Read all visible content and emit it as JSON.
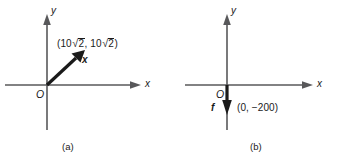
{
  "figure": {
    "background_color": "#ffffff",
    "axis_color": "#58585a",
    "vector_color": "#1a1a1a",
    "text_color": "#1a1a1a"
  },
  "panel_a": {
    "caption": "(a)",
    "x_axis_label": "x",
    "y_axis_label": "y",
    "origin_label": "O",
    "vector_label": "x",
    "coordinate_label": {
      "open": "(10",
      "radical_1": "√",
      "radicand_1": "2",
      "separator": ", 10",
      "radical_2": "√",
      "radicand_2": "2",
      "close": ")",
      "plain_text": "(10√2, 10√2)"
    },
    "vector": {
      "name": "x",
      "direction": "up-right",
      "angle_degrees": 45,
      "components": [
        10,
        10
      ],
      "component_scale": "√2"
    }
  },
  "panel_b": {
    "caption": "(b)",
    "x_axis_label": "x",
    "y_axis_label": "y",
    "origin_label": "O",
    "vector_label": "f",
    "coordinate_label": "(0, −200)",
    "vector": {
      "name": "f",
      "direction": "down",
      "angle_degrees": 270,
      "components": [
        0,
        -200
      ]
    }
  }
}
